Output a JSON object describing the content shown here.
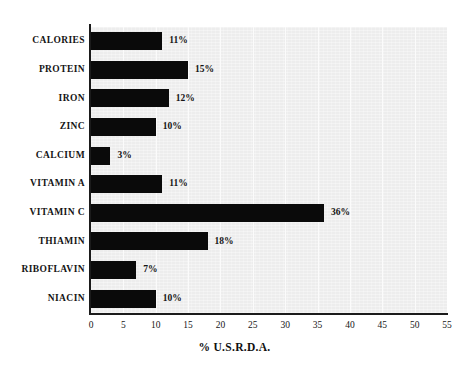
{
  "chart_data": {
    "type": "bar",
    "orientation": "horizontal",
    "title": "",
    "xlabel": "% U.S.R.D.A.",
    "ylabel": "",
    "xlim": [
      0,
      55
    ],
    "xticks": [
      "0",
      "5",
      "10",
      "15",
      "20",
      "25",
      "30",
      "35",
      "40",
      "45",
      "50",
      "55"
    ],
    "grid": "vertical-only",
    "legend": "none",
    "categories": [
      "CALORIES",
      "PROTEIN",
      "IRON",
      "ZINC",
      "CALCIUM",
      "VITAMIN A",
      "VITAMIN C",
      "THIAMIN",
      "RIBOFLAVIN",
      "NIACIN"
    ],
    "values": [
      11,
      15,
      12,
      10,
      3,
      11,
      36,
      18,
      7,
      10
    ],
    "value_labels": [
      "11%",
      "15%",
      "12%",
      "10%",
      "3%",
      "11%",
      "36%",
      "18%",
      "7%",
      "10%"
    ],
    "colors": {
      "bar": "#0a0a0a",
      "plot_background": "#ededed",
      "page_background": "#ffffff",
      "axis": "#1b1b1b",
      "text": "#141414",
      "gridline": "#fbfbfb"
    }
  }
}
